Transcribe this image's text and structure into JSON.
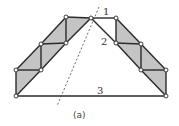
{
  "diagram": {
    "caption": "(a)",
    "colors": {
      "stroke": "#2a2a2a",
      "fill": "#c4c4c4",
      "node_fill": "#ffffff",
      "dashed": "#444444"
    },
    "labels": [
      {
        "id": "member-1",
        "text": "1",
        "x": 103,
        "y": 15
      },
      {
        "id": "member-2",
        "text": "2",
        "x": 101,
        "y": 45
      },
      {
        "id": "member-3",
        "text": "3",
        "x": 97,
        "y": 94
      }
    ],
    "nodes": [
      {
        "id": "A",
        "x": 16,
        "y": 96
      },
      {
        "id": "B",
        "x": 16,
        "y": 70
      },
      {
        "id": "C",
        "x": 41,
        "y": 70
      },
      {
        "id": "D",
        "x": 41,
        "y": 44
      },
      {
        "id": "E",
        "x": 66,
        "y": 43
      },
      {
        "id": "F",
        "x": 66,
        "y": 17
      },
      {
        "id": "G",
        "x": 91,
        "y": 18
      },
      {
        "id": "H",
        "x": 116,
        "y": 18
      },
      {
        "id": "I",
        "x": 116,
        "y": 43
      },
      {
        "id": "J",
        "x": 141,
        "y": 44
      },
      {
        "id": "K",
        "x": 141,
        "y": 70
      },
      {
        "id": "L",
        "x": 166,
        "y": 70
      },
      {
        "id": "M",
        "x": 166,
        "y": 96
      }
    ],
    "shaded_panels": [
      [
        "A",
        "B",
        "C"
      ],
      [
        "B",
        "D",
        "C"
      ],
      [
        "C",
        "D",
        "E"
      ],
      [
        "D",
        "F",
        "E"
      ],
      [
        "E",
        "F",
        "G"
      ],
      [
        "H",
        "I",
        "J"
      ],
      [
        "I",
        "J",
        "K"
      ],
      [
        "J",
        "L",
        "K"
      ],
      [
        "K",
        "L",
        "M"
      ]
    ],
    "members": [
      [
        "A",
        "B"
      ],
      [
        "B",
        "C"
      ],
      [
        "A",
        "C"
      ],
      [
        "B",
        "D"
      ],
      [
        "C",
        "D"
      ],
      [
        "D",
        "E"
      ],
      [
        "C",
        "E"
      ],
      [
        "D",
        "F"
      ],
      [
        "E",
        "F"
      ],
      [
        "F",
        "G"
      ],
      [
        "E",
        "G"
      ],
      [
        "G",
        "H"
      ],
      [
        "G",
        "I"
      ],
      [
        "H",
        "I"
      ],
      [
        "H",
        "J"
      ],
      [
        "I",
        "J"
      ],
      [
        "I",
        "K"
      ],
      [
        "J",
        "K"
      ],
      [
        "J",
        "L"
      ],
      [
        "K",
        "L"
      ],
      [
        "K",
        "M"
      ],
      [
        "L",
        "M"
      ],
      [
        "A",
        "M"
      ]
    ],
    "section_cut": {
      "x1": 99,
      "y1": 7,
      "x2": 57,
      "y2": 106
    }
  }
}
